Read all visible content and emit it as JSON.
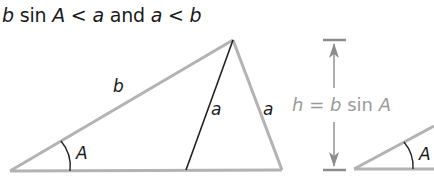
{
  "caption": {
    "part1_var": "b",
    "part1_fn": "sin",
    "part1_angle": "A",
    "op1": "<",
    "part1_rhs": "a",
    "conj": "and",
    "part2_lhs": "a",
    "op2": "<",
    "part2_rhs": "b"
  },
  "triangle": {
    "side_b_label": "b",
    "side_a_inner_label": "a",
    "side_a_outer_label": "a",
    "angle_label": "A"
  },
  "height": {
    "label_h": "h",
    "label_eq": "=",
    "label_b": "b",
    "label_sin": "sin",
    "label_A": "A"
  },
  "small_triangle": {
    "angle_label": "A"
  },
  "colors": {
    "gray_line": "#b3b3b3",
    "dark_line": "#222222",
    "gray_text": "#9a9a9a",
    "text": "#1a1a1a"
  }
}
